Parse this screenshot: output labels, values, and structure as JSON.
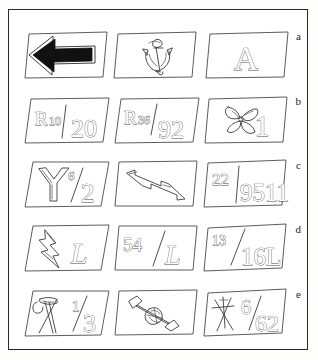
{
  "figure": {
    "type": "illustration-plate",
    "columns": 3,
    "rows": 5,
    "background_color": "#ffffff",
    "frame_color": "#2a2a2a",
    "sketch_stroke_color": "#3c3c3c",
    "fill_color": "#ffffff",
    "solid_ink_color": "#111111"
  },
  "row_labels": [
    "a",
    "b",
    "c",
    "d",
    "e"
  ],
  "rows": [
    {
      "label": "a",
      "tiles": [
        {
          "name": "left-arrow-tile",
          "content_kind": "symbol",
          "symbol": "solid-left-arrow",
          "text": "",
          "shaded": true
        },
        {
          "name": "anchor-tile",
          "content_kind": "symbol",
          "symbol": "anchor",
          "text": "",
          "shaded": false
        },
        {
          "name": "letter-a-tile",
          "content_kind": "letter",
          "symbol": "outlined-letter",
          "text": "A",
          "shaded": false
        }
      ]
    },
    {
      "label": "b",
      "tiles": [
        {
          "name": "r10-20-tile",
          "content_kind": "marking",
          "symbol": "",
          "text": "R10/20",
          "prefix": "R10",
          "suffix": "20",
          "shaded": false
        },
        {
          "name": "r36-92-tile",
          "content_kind": "marking",
          "symbol": "",
          "text": "R36/92",
          "prefix": "R36",
          "suffix": "92",
          "shaded": false
        },
        {
          "name": "propeller-one-tile",
          "content_kind": "symbol-with-number",
          "symbol": "propeller",
          "text": "1",
          "shaded": false
        }
      ]
    },
    {
      "label": "c",
      "tiles": [
        {
          "name": "y-six-two-tile",
          "content_kind": "letter-fraction",
          "symbol": "letter-y",
          "text": "Y6/2",
          "prefix": "6",
          "suffix": "2",
          "shaded": false
        },
        {
          "name": "zigzag-arrow-tile",
          "content_kind": "symbol",
          "symbol": "zigzag-arrow",
          "text": "",
          "shaded": false
        },
        {
          "name": "twentytwo-9511-tile",
          "content_kind": "marking",
          "symbol": "",
          "text": "22/9511",
          "prefix": "22",
          "suffix": "9511",
          "shaded": false
        }
      ]
    },
    {
      "label": "d",
      "tiles": [
        {
          "name": "lightning-l-tile",
          "content_kind": "symbol-with-letter",
          "symbol": "lightning-bolt",
          "text": "L",
          "shaded": false
        },
        {
          "name": "fiftyfour-l-tile",
          "content_kind": "marking",
          "symbol": "",
          "text": "54/L",
          "prefix": "54",
          "suffix": "L",
          "shaded": false
        },
        {
          "name": "thirteen-16l-tile",
          "content_kind": "marking",
          "symbol": "",
          "text": "13/16L",
          "prefix": "13",
          "suffix": "16L",
          "shaded": false
        }
      ]
    },
    {
      "label": "e",
      "tiles": [
        {
          "name": "crossed-tools-third-tile",
          "content_kind": "symbol-with-fraction",
          "symbol": "crossed-hammer-pick",
          "text": "1/3",
          "prefix": "1",
          "suffix": "3",
          "shaded": false
        },
        {
          "name": "wrench-bolt-tile",
          "content_kind": "symbol",
          "symbol": "wrench-and-bolt",
          "text": "",
          "shaded": false
        },
        {
          "name": "crossed-arrows-six-62-tile",
          "content_kind": "symbol-with-fraction",
          "symbol": "crossed-arrows",
          "text": "6/62",
          "prefix": "6",
          "suffix": "62",
          "shaded": false
        }
      ]
    }
  ]
}
